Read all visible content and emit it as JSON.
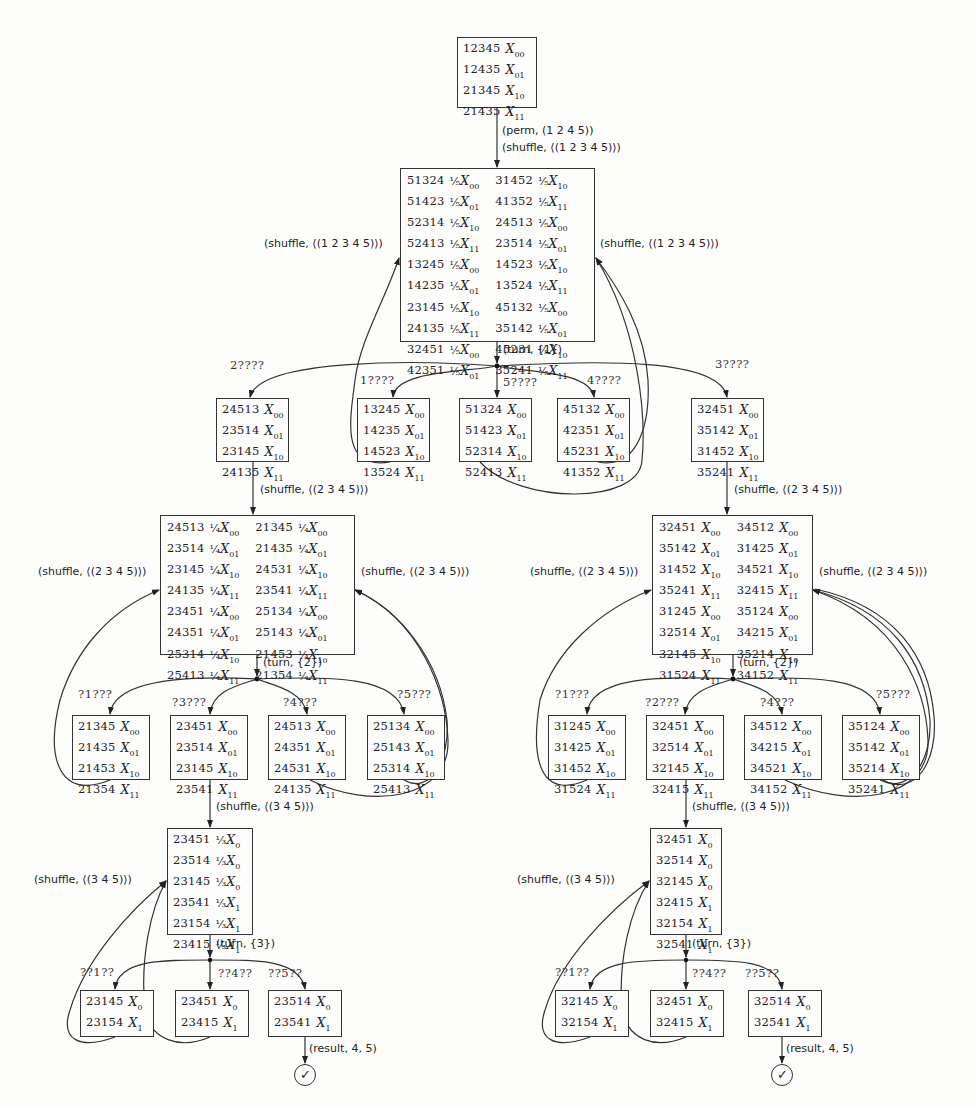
{
  "root": {
    "rows": [
      {
        "perm": "12345",
        "coef": "",
        "x": "X",
        "sub": "00"
      },
      {
        "perm": "12435",
        "coef": "",
        "x": "X",
        "sub": "01"
      },
      {
        "perm": "21345",
        "coef": "",
        "x": "X",
        "sub": "10"
      },
      {
        "perm": "21435",
        "coef": "",
        "x": "X",
        "sub": "11"
      }
    ],
    "edge_label_1": "(perm, (1 2 4 5))",
    "edge_label_2": "(shuffle, ⟨(1 2 3 4 5)⟩)"
  },
  "level1": {
    "left_rows": [
      {
        "perm": "51324",
        "coef": "¹⁄₅",
        "sub": "00"
      },
      {
        "perm": "51423",
        "coef": "¹⁄₅",
        "sub": "01"
      },
      {
        "perm": "52314",
        "coef": "¹⁄₅",
        "sub": "10"
      },
      {
        "perm": "52413",
        "coef": "¹⁄₅",
        "sub": "11"
      },
      {
        "perm": "13245",
        "coef": "¹⁄₅",
        "sub": "00"
      },
      {
        "perm": "14235",
        "coef": "¹⁄₅",
        "sub": "01"
      },
      {
        "perm": "23145",
        "coef": "¹⁄₅",
        "sub": "10"
      },
      {
        "perm": "24135",
        "coef": "¹⁄₅",
        "sub": "11"
      },
      {
        "perm": "32451",
        "coef": "¹⁄₅",
        "sub": "00"
      },
      {
        "perm": "42351",
        "coef": "¹⁄₅",
        "sub": "01"
      }
    ],
    "right_rows": [
      {
        "perm": "31452",
        "coef": "¹⁄₅",
        "sub": "10"
      },
      {
        "perm": "41352",
        "coef": "¹⁄₅",
        "sub": "11"
      },
      {
        "perm": "24513",
        "coef": "¹⁄₅",
        "sub": "00"
      },
      {
        "perm": "23514",
        "coef": "¹⁄₅",
        "sub": "01"
      },
      {
        "perm": "14523",
        "coef": "¹⁄₅",
        "sub": "10"
      },
      {
        "perm": "13524",
        "coef": "¹⁄₅",
        "sub": "11"
      },
      {
        "perm": "45132",
        "coef": "¹⁄₅",
        "sub": "00"
      },
      {
        "perm": "35142",
        "coef": "¹⁄₅",
        "sub": "01"
      },
      {
        "perm": "45231",
        "coef": "¹⁄₅",
        "sub": "10"
      },
      {
        "perm": "35241",
        "coef": "¹⁄₅",
        "sub": "11"
      }
    ],
    "left_loop_label": "(shuffle, ⟨(1 2 3 4 5)⟩)",
    "right_loop_label": "(shuffle, ⟨(1 2 3 4 5)⟩)",
    "turn_label": "(turn, {1})"
  },
  "level2": {
    "branches": [
      {
        "pattern": "2????",
        "rows": [
          {
            "perm": "24513",
            "sub": "00"
          },
          {
            "perm": "23514",
            "sub": "01"
          },
          {
            "perm": "23145",
            "sub": "10"
          },
          {
            "perm": "24135",
            "sub": "11"
          }
        ]
      },
      {
        "pattern": "1????",
        "rows": [
          {
            "perm": "13245",
            "sub": "00"
          },
          {
            "perm": "14235",
            "sub": "01"
          },
          {
            "perm": "14523",
            "sub": "10"
          },
          {
            "perm": "13524",
            "sub": "11"
          }
        ]
      },
      {
        "pattern": "5????",
        "rows": [
          {
            "perm": "51324",
            "sub": "00"
          },
          {
            "perm": "51423",
            "sub": "01"
          },
          {
            "perm": "52314",
            "sub": "10"
          },
          {
            "perm": "52413",
            "sub": "11"
          }
        ]
      },
      {
        "pattern": "4????",
        "rows": [
          {
            "perm": "45132",
            "sub": "00"
          },
          {
            "perm": "42351",
            "sub": "01"
          },
          {
            "perm": "45231",
            "sub": "10"
          },
          {
            "perm": "41352",
            "sub": "11"
          }
        ]
      },
      {
        "pattern": "3????",
        "rows": [
          {
            "perm": "32451",
            "sub": "00"
          },
          {
            "perm": "35142",
            "sub": "01"
          },
          {
            "perm": "31452",
            "sub": "10"
          },
          {
            "perm": "35241",
            "sub": "11"
          }
        ]
      }
    ],
    "left_edge_label": "(shuffle, ⟨(2 3 4 5)⟩)",
    "right_edge_label": "(shuffle, ⟨(2 3 4 5)⟩)"
  },
  "left_tree": {
    "level3": {
      "left_rows": [
        {
          "perm": "24513",
          "coef": "¹⁄₄",
          "sub": "00"
        },
        {
          "perm": "23514",
          "coef": "¹⁄₄",
          "sub": "01"
        },
        {
          "perm": "23145",
          "coef": "¹⁄₄",
          "sub": "10"
        },
        {
          "perm": "24135",
          "coef": "¹⁄₄",
          "sub": "11"
        },
        {
          "perm": "23451",
          "coef": "¹⁄₄",
          "sub": "00"
        },
        {
          "perm": "24351",
          "coef": "¹⁄₄",
          "sub": "01"
        },
        {
          "perm": "25314",
          "coef": "¹⁄₄",
          "sub": "10"
        },
        {
          "perm": "25413",
          "coef": "¹⁄₄",
          "sub": "11"
        }
      ],
      "right_rows": [
        {
          "perm": "21345",
          "coef": "¹⁄₄",
          "sub": "00"
        },
        {
          "perm": "21435",
          "coef": "¹⁄₄",
          "sub": "01"
        },
        {
          "perm": "24531",
          "coef": "¹⁄₄",
          "sub": "10"
        },
        {
          "perm": "23541",
          "coef": "¹⁄₄",
          "sub": "11"
        },
        {
          "perm": "25134",
          "coef": "¹⁄₄",
          "sub": "00"
        },
        {
          "perm": "25143",
          "coef": "¹⁄₄",
          "sub": "01"
        },
        {
          "perm": "21453",
          "coef": "¹⁄₄",
          "sub": "10"
        },
        {
          "perm": "21354",
          "coef": "¹⁄₄",
          "sub": "11"
        }
      ],
      "left_loop_label": "(shuffle, ⟨(2 3 4 5)⟩)",
      "right_loop_label": "(shuffle, ⟨(2 3 4 5)⟩)",
      "turn_label": "(turn, {2})"
    },
    "level4": [
      {
        "pattern": "?1???",
        "rows": [
          {
            "perm": "21345",
            "sub": "00"
          },
          {
            "perm": "21435",
            "sub": "01"
          },
          {
            "perm": "21453",
            "sub": "10"
          },
          {
            "perm": "21354",
            "sub": "11"
          }
        ]
      },
      {
        "pattern": "?3???",
        "rows": [
          {
            "perm": "23451",
            "sub": "00"
          },
          {
            "perm": "23514",
            "sub": "01"
          },
          {
            "perm": "23145",
            "sub": "10"
          },
          {
            "perm": "23541",
            "sub": "11"
          }
        ]
      },
      {
        "pattern": "?4???",
        "rows": [
          {
            "perm": "24513",
            "sub": "00"
          },
          {
            "perm": "24351",
            "sub": "01"
          },
          {
            "perm": "24531",
            "sub": "10"
          },
          {
            "perm": "24135",
            "sub": "11"
          }
        ]
      },
      {
        "pattern": "?5???",
        "rows": [
          {
            "perm": "25134",
            "sub": "00"
          },
          {
            "perm": "25143",
            "sub": "01"
          },
          {
            "perm": "25314",
            "sub": "10"
          },
          {
            "perm": "25413",
            "sub": "11"
          }
        ]
      }
    ],
    "shuffle_label": "(shuffle, ⟨(3 4 5)⟩)",
    "level5": {
      "rows": [
        {
          "perm": "23451",
          "coef": "¹⁄₃",
          "sub": "0"
        },
        {
          "perm": "23514",
          "coef": "¹⁄₃",
          "sub": "0"
        },
        {
          "perm": "23145",
          "coef": "¹⁄₃",
          "sub": "0"
        },
        {
          "perm": "23541",
          "coef": "¹⁄₃",
          "sub": "1"
        },
        {
          "perm": "23154",
          "coef": "¹⁄₃",
          "sub": "1"
        },
        {
          "perm": "23415",
          "coef": "¹⁄₃",
          "sub": "1"
        }
      ],
      "loop_label": "(shuffle, ⟨(3 4 5)⟩)",
      "turn_label": "(turn, {3})"
    },
    "level6": [
      {
        "pattern": "??1??",
        "rows": [
          {
            "perm": "23145",
            "sub": "0"
          },
          {
            "perm": "23154",
            "sub": "1"
          }
        ]
      },
      {
        "pattern": "??4??",
        "rows": [
          {
            "perm": "23451",
            "sub": "0"
          },
          {
            "perm": "23415",
            "sub": "1"
          }
        ]
      },
      {
        "pattern": "??5??",
        "rows": [
          {
            "perm": "23514",
            "sub": "0"
          },
          {
            "perm": "23541",
            "sub": "1"
          }
        ]
      }
    ],
    "result_label": "(result, 4, 5)",
    "check_symbol": "✓"
  },
  "right_tree": {
    "level3": {
      "left_rows": [
        {
          "perm": "32451",
          "coef": "",
          "sub": "00"
        },
        {
          "perm": "35142",
          "coef": "",
          "sub": "01"
        },
        {
          "perm": "31452",
          "coef": "",
          "sub": "10"
        },
        {
          "perm": "35241",
          "coef": "",
          "sub": "11"
        },
        {
          "perm": "31245",
          "coef": "",
          "sub": "00"
        },
        {
          "perm": "32514",
          "coef": "",
          "sub": "01"
        },
        {
          "perm": "32145",
          "coef": "",
          "sub": "10"
        },
        {
          "perm": "31524",
          "coef": "",
          "sub": "11"
        }
      ],
      "right_rows": [
        {
          "perm": "34512",
          "coef": "",
          "sub": "00"
        },
        {
          "perm": "31425",
          "coef": "",
          "sub": "01"
        },
        {
          "perm": "34521",
          "coef": "",
          "sub": "10"
        },
        {
          "perm": "32415",
          "coef": "",
          "sub": "11"
        },
        {
          "perm": "35124",
          "coef": "",
          "sub": "00"
        },
        {
          "perm": "34215",
          "coef": "",
          "sub": "01"
        },
        {
          "perm": "35214",
          "coef": "",
          "sub": "10"
        },
        {
          "perm": "34152",
          "coef": "",
          "sub": "11"
        }
      ],
      "left_loop_label": "(shuffle, ⟨(2 3 4 5)⟩)",
      "right_loop_label": "(shuffle, ⟨(2 3 4 5)⟩)",
      "turn_label": "(turn, {2})"
    },
    "level4": [
      {
        "pattern": "?1???",
        "rows": [
          {
            "perm": "31245",
            "sub": "00"
          },
          {
            "perm": "31425",
            "sub": "01"
          },
          {
            "perm": "31452",
            "sub": "10"
          },
          {
            "perm": "31524",
            "sub": "11"
          }
        ]
      },
      {
        "pattern": "?2???",
        "rows": [
          {
            "perm": "32451",
            "sub": "00"
          },
          {
            "perm": "32514",
            "sub": "01"
          },
          {
            "perm": "32145",
            "sub": "10"
          },
          {
            "perm": "32415",
            "sub": "11"
          }
        ]
      },
      {
        "pattern": "?4???",
        "rows": [
          {
            "perm": "34512",
            "sub": "00"
          },
          {
            "perm": "34215",
            "sub": "01"
          },
          {
            "perm": "34521",
            "sub": "10"
          },
          {
            "perm": "34152",
            "sub": "11"
          }
        ]
      },
      {
        "pattern": "?5???",
        "rows": [
          {
            "perm": "35124",
            "sub": "00"
          },
          {
            "perm": "35142",
            "sub": "01"
          },
          {
            "perm": "35214",
            "sub": "10"
          },
          {
            "perm": "35241",
            "sub": "11"
          }
        ]
      }
    ],
    "shuffle_label": "(shuffle, ⟨(3 4 5)⟩)",
    "level5": {
      "rows": [
        {
          "perm": "32451",
          "coef": "",
          "sub": "0"
        },
        {
          "perm": "32514",
          "coef": "",
          "sub": "0"
        },
        {
          "perm": "32145",
          "coef": "",
          "sub": "0"
        },
        {
          "perm": "32415",
          "coef": "",
          "sub": "1"
        },
        {
          "perm": "32154",
          "coef": "",
          "sub": "1"
        },
        {
          "perm": "32541",
          "coef": "",
          "sub": "1"
        }
      ],
      "loop_label": "(shuffle, ⟨(3 4 5)⟩)",
      "turn_label": "(turn, {3})"
    },
    "level6": [
      {
        "pattern": "??1??",
        "rows": [
          {
            "perm": "32145",
            "sub": "0"
          },
          {
            "perm": "32154",
            "sub": "1"
          }
        ]
      },
      {
        "pattern": "??4??",
        "rows": [
          {
            "perm": "32451",
            "sub": "0"
          },
          {
            "perm": "32415",
            "sub": "1"
          }
        ]
      },
      {
        "pattern": "??5??",
        "rows": [
          {
            "perm": "32514",
            "sub": "0"
          },
          {
            "perm": "32541",
            "sub": "1"
          }
        ]
      }
    ],
    "result_label": "(result, 4, 5)",
    "check_symbol": "✓"
  },
  "x_symbol": "X"
}
